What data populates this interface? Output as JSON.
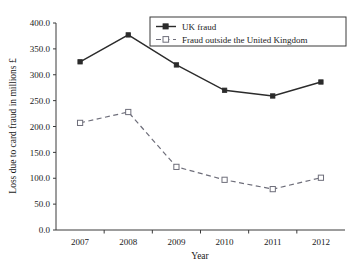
{
  "chart_data": {
    "type": "line",
    "title": "",
    "xlabel": "Year",
    "ylabel": "Loss due to card fraud in millions £",
    "categories": [
      "2007",
      "2008",
      "2009",
      "2010",
      "2011",
      "2012"
    ],
    "x": [
      2007,
      2008,
      2009,
      2010,
      2011,
      2012
    ],
    "xlim": [
      2006.5,
      2012.5
    ],
    "ylim": [
      0,
      400
    ],
    "yticks": [
      0,
      50,
      100,
      150,
      200,
      250,
      300,
      350,
      400
    ],
    "ytick_labels": [
      "0.0",
      "50.0",
      "100.0",
      "150.0",
      "200.0",
      "250.0",
      "300.0",
      "350.0",
      "400.0"
    ],
    "grid": false,
    "legend_position": "top-right",
    "series": [
      {
        "name": "UK fraud",
        "marker": "filled-square",
        "line_style": "solid",
        "color": "#2b2b2b",
        "values": [
          325,
          377,
          319,
          270,
          259,
          286
        ]
      },
      {
        "name": "Fraud outside the United Kingdom",
        "marker": "open-square",
        "line_style": "dashed",
        "color": "#6e6e7a",
        "values": [
          207,
          228,
          122,
          97,
          79,
          101
        ]
      }
    ]
  },
  "axes": {
    "x_title": "Year",
    "y_title": "Loss due to card fraud in millions £"
  },
  "legend": {
    "entries": [
      {
        "label": "UK fraud"
      },
      {
        "label": "Fraud outside the United Kingdom"
      }
    ]
  }
}
